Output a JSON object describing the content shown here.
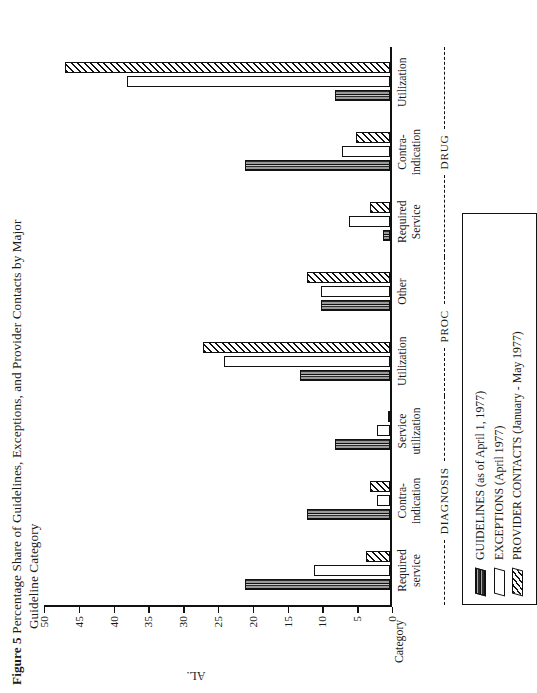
{
  "figure": {
    "number_label": "Figure 5",
    "title_line1": "Percentage Share of Guidelines, Exceptions, and Provider Contacts by Major",
    "title_line2": "Guideline Category"
  },
  "axes": {
    "value_axis_title": "AL.",
    "category_axis_title": "Category",
    "value_ticks": [
      "50",
      "45",
      "40",
      "35",
      "30",
      "25",
      "20",
      "15",
      "10",
      "5",
      "0"
    ],
    "value_min": 0,
    "value_max": 50,
    "value_step": 5
  },
  "legend": {
    "items": [
      {
        "label": "GUIDELINES (as of April 1, 1977)",
        "pattern": "dark-striped-swatch"
      },
      {
        "label": "EXCEPTIONS (April 1977)",
        "pattern": "hollow-white-swatch"
      },
      {
        "label": "PROVIDER CONTACTS (January - May 1977)",
        "pattern": "diagonal-hatch-swatch"
      }
    ]
  },
  "groups": [
    {
      "label": "DIAGNOSIS",
      "span": 3
    },
    {
      "label": "PROC",
      "span": 2
    },
    {
      "label": "DRUG",
      "span": 3
    }
  ],
  "chart_data": {
    "type": "bar",
    "orientation": "vertical",
    "title": "Figure 5 Percentage Share of Guidelines, Exceptions, and Provider Contacts by Major Guideline Category",
    "xlabel": "Category",
    "ylabel": "AL.",
    "ylim": [
      0,
      50
    ],
    "ytick_step": 5,
    "grid": false,
    "legend_position": "below-plot-boxed",
    "categories": [
      "Required service",
      "Contra-indication",
      "Service utilization",
      "Utilization",
      "Other",
      "Required Service",
      "Contra-indication",
      "Utilization"
    ],
    "category_lines": [
      [
        "Required",
        "service"
      ],
      [
        "Contra-",
        "indication"
      ],
      [
        "Service",
        "utilization"
      ],
      [
        "Utilization"
      ],
      [
        "Other"
      ],
      [
        "Required",
        "Service"
      ],
      [
        "Contra-",
        "indication"
      ],
      [
        "Utilization"
      ]
    ],
    "category_groups": [
      "DIAGNOSIS",
      "DIAGNOSIS",
      "DIAGNOSIS",
      "PROC",
      "PROC",
      "DRUG",
      "DRUG",
      "DRUG"
    ],
    "series": [
      {
        "name": "GUIDELINES (as of April 1, 1977)",
        "values": [
          21,
          12,
          8,
          13,
          10,
          1,
          21,
          8
        ]
      },
      {
        "name": "EXCEPTIONS (April 1977)",
        "values": [
          11,
          2,
          2,
          24,
          10,
          6,
          7,
          38
        ]
      },
      {
        "name": "PROVIDER CONTACTS (January - May 1977)",
        "values": [
          3.5,
          3,
          0.3,
          27,
          12,
          3,
          5,
          47
        ]
      }
    ]
  }
}
